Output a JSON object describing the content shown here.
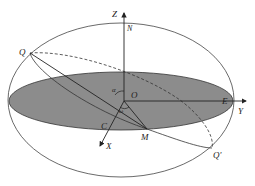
{
  "diagram": {
    "labels": {
      "z_axis": "Z",
      "north": "N",
      "q": "Q",
      "q_prime": "Q'",
      "origin": "O",
      "alpha": "α",
      "omega": "ω",
      "e": "E",
      "y_axis": "Y",
      "c": "C",
      "m": "M",
      "x_axis": "X"
    },
    "colors": {
      "stroke": "#333333",
      "plane_fill": "#8c8c8c",
      "background": "#ffffff"
    }
  }
}
